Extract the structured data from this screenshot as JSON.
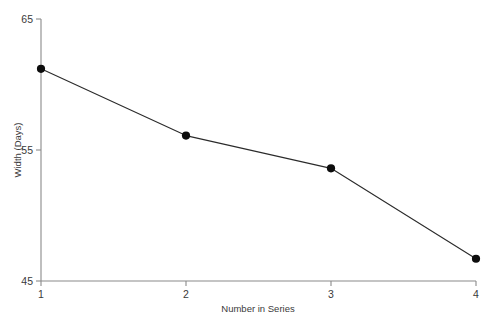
{
  "chart_data": {
    "type": "line",
    "title": "",
    "subtitle": "",
    "xlabel": "Number in Series",
    "ylabel": "Width (Days)",
    "x": [
      1,
      2,
      3,
      4
    ],
    "values": [
      61.2,
      56.1,
      53.6,
      46.7
    ],
    "series": [
      {
        "name": "",
        "values": [
          61.2,
          56.1,
          53.6,
          46.7
        ]
      }
    ],
    "xlim": [
      1,
      4
    ],
    "ylim": [
      45,
      65
    ],
    "xticks": [
      1,
      2,
      3,
      4
    ],
    "xtick_labels": [
      "1",
      "2",
      "3",
      "4"
    ],
    "yticks": [
      45,
      55,
      65
    ],
    "ytick_labels": [
      "45",
      "55",
      "65"
    ],
    "grid": false,
    "legend": null,
    "legend_position": "none",
    "annotations": [],
    "marker": "circle",
    "line_color": "#2b2b2b",
    "marker_color": "#0d0d0d",
    "axis_color": "#8a8a8a",
    "text_color": "#3a3a3a",
    "background_color": "#ffffff"
  },
  "axes": {
    "y_tick_top": "65",
    "y_tick_mid": "55",
    "y_tick_bottom": "45",
    "x_tick_1": "1",
    "x_tick_2": "2",
    "x_tick_3": "3",
    "x_tick_4": "4",
    "y_title": "Width (Days)",
    "x_title": "Number in Series"
  }
}
